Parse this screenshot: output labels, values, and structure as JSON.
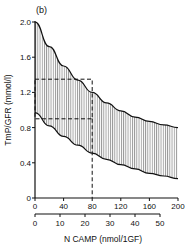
{
  "chart_data": {
    "type": "area",
    "panel_label": "(b)",
    "title": "",
    "ylabel": "TmP/GFR (mmol/l)",
    "xlabel": "N CAMP (nmol/1GF)",
    "ylim": [
      0,
      2.0
    ],
    "xlim": [
      0,
      200
    ],
    "y_ticks": [
      "0",
      "0.4",
      "0.8",
      "1.2",
      "1.6",
      "2.0"
    ],
    "x_ticks_primary": [
      "0",
      "40",
      "80",
      "120",
      "160",
      "200"
    ],
    "x_ticks_secondary": [
      "0",
      "10",
      "20",
      "30",
      "40",
      "50"
    ],
    "grid": false,
    "series": [
      {
        "name": "upper bound",
        "x": [
          0,
          20,
          40,
          60,
          80,
          100,
          120,
          140,
          160,
          180,
          200
        ],
        "values": [
          2.0,
          1.72,
          1.5,
          1.34,
          1.2,
          1.08,
          0.99,
          0.92,
          0.87,
          0.83,
          0.8
        ]
      },
      {
        "name": "lower bound",
        "x": [
          0,
          20,
          40,
          60,
          80,
          100,
          120,
          140,
          160,
          180,
          200
        ],
        "values": [
          0.97,
          0.82,
          0.7,
          0.6,
          0.51,
          0.44,
          0.38,
          0.33,
          0.28,
          0.25,
          0.22
        ]
      }
    ],
    "shaded_region": "between upper and lower bound (vertical hatching)",
    "annotations": [
      {
        "type": "dashed-box",
        "x": [
          0,
          80
        ],
        "y": [
          0.9,
          1.35
        ]
      },
      {
        "type": "dashed-vline",
        "x": 80,
        "y": [
          0,
          0.9
        ]
      }
    ]
  }
}
